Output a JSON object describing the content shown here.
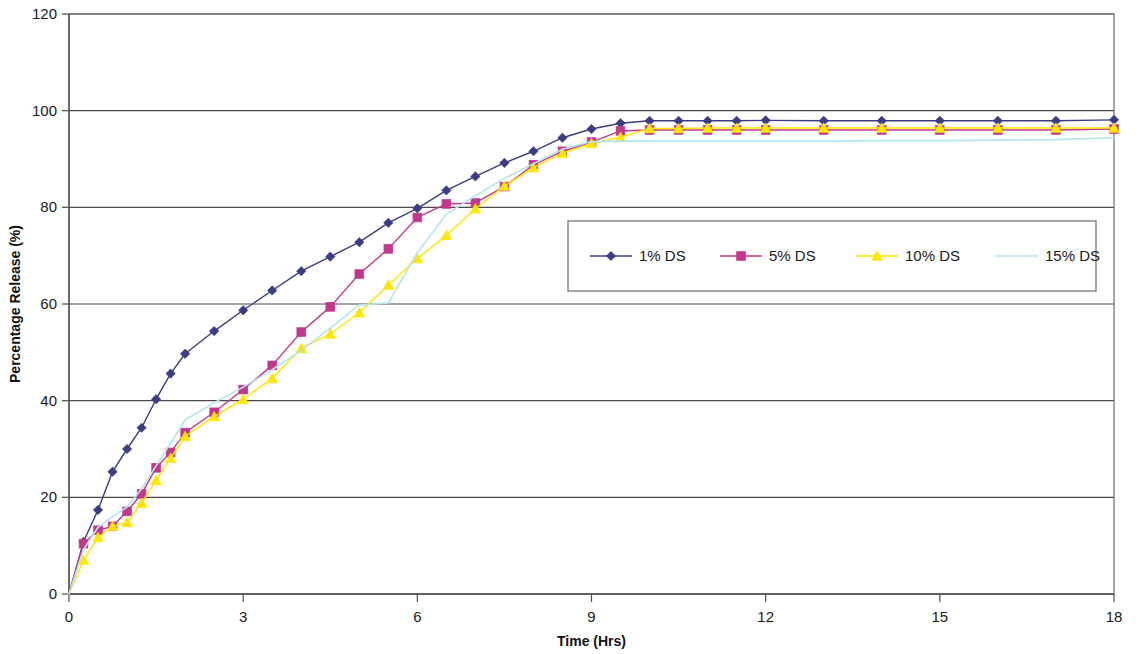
{
  "chart_data": {
    "type": "line",
    "title": "",
    "xlabel": "Time (Hrs)",
    "ylabel": "Percentage Release (%)",
    "xlim": [
      0,
      18
    ],
    "ylim": [
      0,
      120
    ],
    "xticks": [
      0,
      3,
      6,
      9,
      12,
      15,
      18
    ],
    "xtick_labels": [
      "0",
      "3",
      "6",
      "9",
      "12",
      "15",
      "18"
    ],
    "yticks": [
      0,
      20,
      40,
      60,
      80,
      100,
      120
    ],
    "ytick_labels": [
      "0",
      "20",
      "40",
      "60",
      "80",
      "100",
      "120"
    ],
    "grid": "horizontal",
    "legend_position": "inside-center-right",
    "series": [
      {
        "name": "1% DS",
        "color": "#3c3c82",
        "marker": "diamond",
        "marker_color": "#3c3c82",
        "x": [
          0,
          0.25,
          0.5,
          0.75,
          1,
          1.25,
          1.5,
          1.75,
          2,
          2.5,
          3,
          3.5,
          4,
          4.5,
          5,
          5.5,
          6,
          6.5,
          7,
          7.5,
          8,
          8.5,
          9,
          9.5,
          10,
          10.5,
          11,
          11.5,
          12,
          13,
          14,
          15,
          16,
          17,
          18
        ],
        "y": [
          0,
          10.8,
          17.4,
          25.3,
          30.0,
          34.4,
          40.3,
          45.6,
          49.7,
          54.4,
          58.7,
          62.8,
          66.8,
          69.8,
          72.8,
          76.8,
          79.8,
          83.5,
          86.4,
          89.2,
          91.6,
          94.4,
          96.2,
          97.4,
          97.9,
          97.9,
          97.9,
          97.9,
          98.0,
          97.9,
          97.9,
          97.9,
          97.9,
          97.9,
          98.1
        ]
      },
      {
        "name": "5% DS",
        "color": "#c23a86",
        "marker": "square",
        "marker_color": "#c2368c",
        "x": [
          0,
          0.25,
          0.5,
          0.75,
          1,
          1.25,
          1.5,
          1.75,
          2,
          2.5,
          3,
          3.5,
          4,
          4.5,
          5,
          5.5,
          6,
          6.5,
          7,
          7.5,
          8,
          8.5,
          9,
          9.5,
          10,
          10.5,
          11,
          11.5,
          12,
          13,
          14,
          15,
          16,
          17,
          18
        ],
        "y": [
          0,
          10.4,
          13.2,
          14.0,
          17.1,
          20.7,
          26.1,
          29.3,
          33.4,
          37.6,
          42.3,
          47.3,
          54.2,
          59.4,
          66.2,
          71.4,
          77.9,
          80.7,
          80.9,
          84.3,
          88.8,
          91.6,
          93.5,
          95.8,
          96.0,
          96.0,
          96.0,
          96.0,
          96.0,
          96.0,
          96.0,
          96.0,
          96.0,
          96.0,
          96.2
        ]
      },
      {
        "name": "10% DS",
        "color": "#ffe600",
        "marker": "triangle",
        "marker_color": "#ffe600",
        "x": [
          0,
          0.25,
          0.5,
          0.75,
          1,
          1.25,
          1.5,
          1.75,
          2,
          2.5,
          3,
          3.5,
          4,
          4.5,
          5,
          5.5,
          6,
          6.5,
          7,
          7.5,
          8,
          8.5,
          9,
          9.5,
          10,
          10.5,
          11,
          11.5,
          12,
          13,
          14,
          15,
          16,
          17,
          18
        ],
        "y": [
          0,
          7.0,
          11.7,
          14.0,
          14.8,
          18.8,
          23.5,
          28.1,
          32.6,
          36.7,
          40.3,
          44.6,
          50.8,
          53.8,
          58.2,
          63.9,
          69.4,
          74.2,
          79.7,
          84.4,
          88.2,
          91.2,
          93.2,
          94.5,
          96.3,
          96.3,
          96.4,
          96.4,
          96.4,
          96.4,
          96.4,
          96.4,
          96.4,
          96.4,
          96.4
        ]
      },
      {
        "name": "15% DS",
        "color": "#b2e5ee",
        "marker": "none",
        "marker_color": "#b2e5ee",
        "x": [
          0,
          0.25,
          0.5,
          0.75,
          1,
          1.25,
          1.5,
          1.75,
          2,
          2.5,
          3,
          3.5,
          4,
          4.5,
          5,
          5.5,
          6,
          6.5,
          7,
          7.5,
          8,
          8.5,
          9,
          9.5,
          10,
          10.5,
          11,
          11.5,
          12,
          13,
          14,
          15,
          16,
          17,
          18
        ],
        "y": [
          0,
          9.2,
          13.8,
          16.0,
          18.0,
          21.8,
          26.5,
          31.2,
          36.0,
          39.6,
          42.8,
          46.4,
          50.4,
          55.0,
          59.8,
          60.2,
          70.6,
          78.6,
          82.4,
          86.0,
          89.0,
          92.0,
          93.6,
          93.7,
          93.7,
          93.7,
          93.7,
          93.7,
          93.7,
          93.7,
          93.8,
          93.8,
          93.9,
          94.0,
          94.4
        ]
      }
    ]
  },
  "legend": {
    "entries": [
      {
        "label": "1% DS"
      },
      {
        "label": "5% DS"
      },
      {
        "label": "10% DS"
      },
      {
        "label": "15% DS"
      }
    ]
  }
}
